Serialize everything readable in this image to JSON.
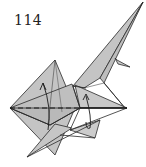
{
  "step": {
    "number": "114"
  },
  "diagram": {
    "colors": {
      "paper": "#c4c4c4",
      "paper_dark": "#a9a9a9",
      "line": "#2a2a2a",
      "background": "#ffffff"
    },
    "annotations": [
      "dashed-valley-fold-line",
      "fold-arrow-left",
      "fold-arrow-right"
    ]
  }
}
